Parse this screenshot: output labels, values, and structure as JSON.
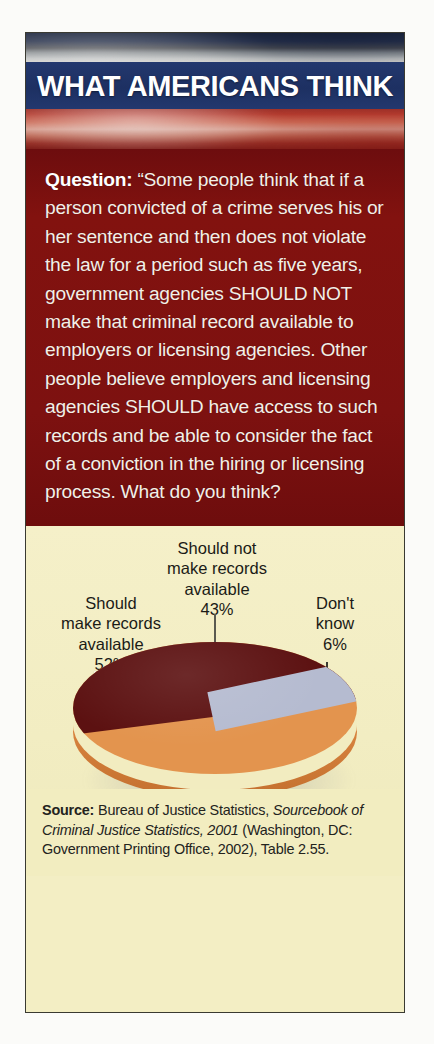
{
  "header": {
    "title": "WHAT AMERICANS THINK",
    "banner_color": "#1f3468",
    "flag_image": "american-flag-photo"
  },
  "question": {
    "label": "Question:",
    "text": " “Some people think that if a person convicted of a crime serves his or her sentence and then does not violate the law for a period such as five years, government agencies SHOULD NOT make that criminal record available to employers or licensing agencies. Other people believe employers and licensing agencies SHOULD have access to such records and be able to consider the fact of a conviction in the hiring or licensing process. What do you think?",
    "background_color": "#7d100f",
    "text_color": "#f4efe7"
  },
  "chart_data": {
    "type": "pie",
    "title": "",
    "categories": [
      "Should make records available",
      "Should not make records available",
      "Don't know"
    ],
    "values": [
      52,
      43,
      6
    ],
    "value_labels": [
      "52%",
      "43%",
      "6%"
    ],
    "colors": [
      "#e3944e",
      "#5c1111",
      "#b5bbd0"
    ],
    "background_color": "#f4efc6",
    "legend": "none",
    "labels": [
      {
        "name": "should-make",
        "text": "Should\nmake records\navailable\n52%",
        "percent": "52%"
      },
      {
        "name": "should-not-make",
        "text": "Should not\nmake records\navailable\n43%",
        "percent": "43%"
      },
      {
        "name": "dont-know",
        "text": "Don't\nknow\n6%",
        "percent": "6%"
      }
    ],
    "three_d": true
  },
  "source": {
    "label": "Source:",
    "part1": " Bureau of Justice Statistics, ",
    "italic": "Sourcebook of Criminal Justice Statistics, 2001",
    "part2": " (Washington, DC: Government Printing Office, 2002), Table 2.55."
  }
}
